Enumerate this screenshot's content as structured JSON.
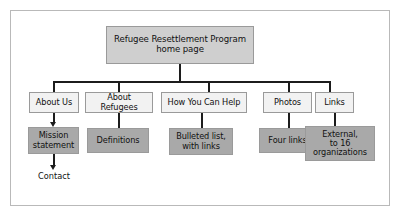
{
  "diagram": {
    "root": {
      "label": "Refugee Resettlement Program\nhome page"
    },
    "sections": [
      {
        "label": "About Us"
      },
      {
        "label": "About Refugees"
      },
      {
        "label": "How You Can Help"
      },
      {
        "label": "Photos"
      },
      {
        "label": "Links"
      }
    ],
    "details": [
      {
        "label": "Mission\nstatement"
      },
      {
        "label": "Definitions"
      },
      {
        "label": "Bulleted list,\nwith links"
      },
      {
        "label": "Four links"
      },
      {
        "label": "External,\nto 16\norganizations"
      }
    ],
    "leaf": {
      "label": "Contact"
    },
    "colors": {
      "root_fill": "#cfcfcf",
      "section_fill": "#f2f2f2",
      "detail_fill": "#a9a9a9",
      "node_border": "#9a9a9a",
      "connector": "#1c1c1c",
      "frame_border": "#b9b9b9",
      "background": "#ffffff",
      "text": "#111111"
    }
  }
}
